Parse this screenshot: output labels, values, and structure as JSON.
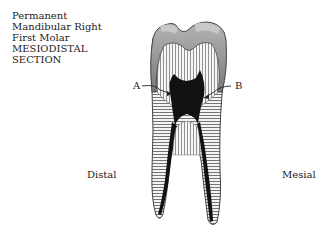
{
  "title": {
    "lines": [
      "Permanent",
      "Mandibular Right",
      "First Molar",
      "MESIODISTAL",
      "SECTION"
    ]
  },
  "labels": {
    "A": "A",
    "B": "B",
    "distal": "Distal",
    "mesial": "Mesial"
  },
  "colors": {
    "enamel": "#8a8a8a",
    "dentin_lines": "#555555",
    "pulp": "#111111",
    "background": "#ffffff"
  }
}
